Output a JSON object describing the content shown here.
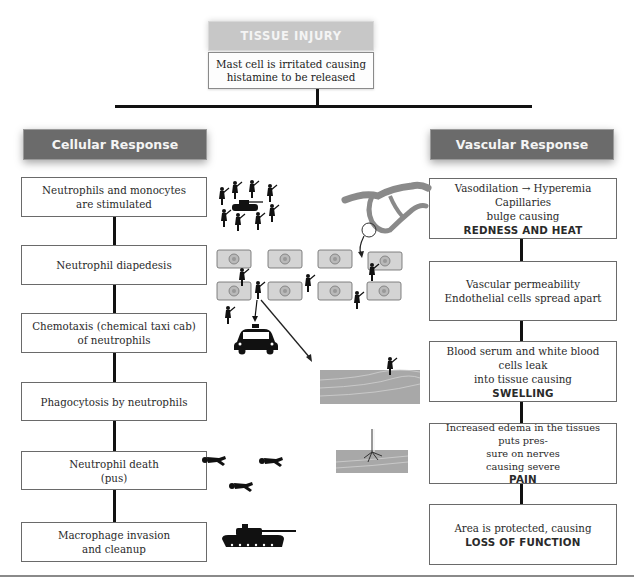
{
  "top": {
    "title": "TISSUE INJURY",
    "subtitle_line1": "Mast cell is irritated causing",
    "subtitle_line2": "histamine to be released"
  },
  "cellular": {
    "header": "Cellular Response",
    "steps": [
      {
        "line1": "Neutrophils and monocytes",
        "line2": "are stimulated"
      },
      {
        "line1": "Neutrophil diapedesis",
        "line2": ""
      },
      {
        "line1": "Chemotaxis (chemical taxi cab)",
        "line2": "of neutrophils"
      },
      {
        "line1": "Phagocytosis by neutrophils",
        "line2": ""
      },
      {
        "line1": "Neutrophil death",
        "line2": "(pus)"
      },
      {
        "line1": "Macrophage invasion",
        "line2": "and cleanup"
      }
    ]
  },
  "vascular": {
    "header": "Vascular Response",
    "steps": [
      {
        "line1": "Vasodilation → Hyperemia Capillaries",
        "line2": "bulge causing",
        "emphasis": "REDNESS AND HEAT"
      },
      {
        "line1": "Vascular permeability",
        "line2": "Endothelial cells spread apart",
        "emphasis": ""
      },
      {
        "line1": "Blood serum and white blood cells leak",
        "line2": "into tissue causing",
        "emphasis": "SWELLING"
      },
      {
        "line1": "Increased edema in the tissues puts pres-",
        "line2": "sure on nerves",
        "line3": "causing severe",
        "emphasis": "PAIN"
      },
      {
        "line1": "Area is protected, causing",
        "line2": "",
        "emphasis": "LOSS OF FUNCTION"
      }
    ]
  },
  "illustrations": {
    "soldiers_tank": "soldiers-surrounding-tank",
    "cells_grid": "endothelial-cells-with-soldiers",
    "taxi": "taxi-cab",
    "capillary": "branching-capillary",
    "tissue_soldier": "soldier-on-tissue-layer",
    "nerve_tissue": "nerve-in-tissue",
    "fallen_soldiers": "dead-soldiers",
    "tank": "tank"
  },
  "colors": {
    "top_title_bg": "#c7c7c7",
    "header_bg": "#6b6b6b",
    "box_border": "#6a6a6a",
    "connector": "#111111"
  }
}
